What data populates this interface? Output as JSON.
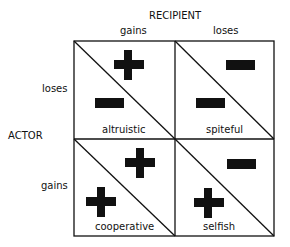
{
  "axes": {
    "recipient_title": "RECIPIENT",
    "recipient_cols": [
      "gains",
      "loses"
    ],
    "actor_title": "ACTOR",
    "actor_rows": [
      "loses",
      "gains"
    ]
  },
  "cells": [
    {
      "name": "altruistic",
      "actor": "minus",
      "recipient": "plus"
    },
    {
      "name": "spiteful",
      "actor": "minus",
      "recipient": "minus"
    },
    {
      "name": "cooperative",
      "actor": "plus",
      "recipient": "plus"
    },
    {
      "name": "selfish",
      "actor": "plus",
      "recipient": "minus"
    }
  ]
}
